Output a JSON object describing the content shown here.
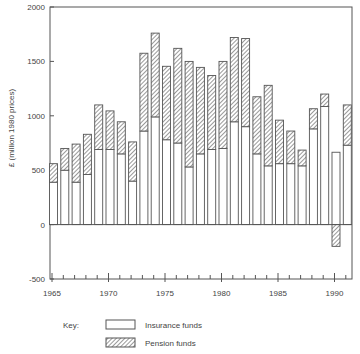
{
  "chart_data": {
    "type": "bar",
    "stacked": true,
    "title": "",
    "xlabel": "",
    "ylabel": "£ (million 1980 prices)",
    "ylim": [
      -500,
      2000
    ],
    "yticks": [
      2000,
      1500,
      1000,
      500,
      0,
      -500
    ],
    "xticks_labeled": [
      1965,
      1970,
      1975,
      1980,
      1985,
      1990
    ],
    "grid": false,
    "legend_position": "bottom",
    "legend_title": "Key:",
    "categories": [
      1965,
      1966,
      1967,
      1968,
      1969,
      1970,
      1971,
      1972,
      1973,
      1974,
      1975,
      1976,
      1977,
      1978,
      1979,
      1980,
      1981,
      1982,
      1983,
      1984,
      1985,
      1986,
      1987,
      1988,
      1989,
      1990,
      1991
    ],
    "series": [
      {
        "name": "Insurance funds",
        "pattern": "plain",
        "values": [
          390,
          500,
          390,
          460,
          690,
          690,
          650,
          400,
          860,
          990,
          780,
          750,
          530,
          650,
          690,
          700,
          945,
          900,
          650,
          540,
          560,
          560,
          540,
          880,
          1085,
          665,
          730
        ]
      },
      {
        "name": "Pension funds",
        "pattern": "hatched",
        "values": [
          170,
          200,
          350,
          370,
          410,
          355,
          295,
          360,
          715,
          770,
          675,
          870,
          970,
          795,
          680,
          800,
          775,
          810,
          525,
          740,
          400,
          300,
          145,
          185,
          115,
          -200,
          370
        ]
      }
    ],
    "totals": [
      560,
      700,
      740,
      830,
      1100,
      1045,
      945,
      760,
      1575,
      1760,
      1455,
      1620,
      1500,
      1445,
      1370,
      1500,
      1720,
      1710,
      1175,
      1280,
      960,
      860,
      685,
      1065,
      1200,
      665,
      1100
    ]
  },
  "colors": {
    "line": "#555555",
    "background": "#ffffff",
    "text": "#444444"
  }
}
